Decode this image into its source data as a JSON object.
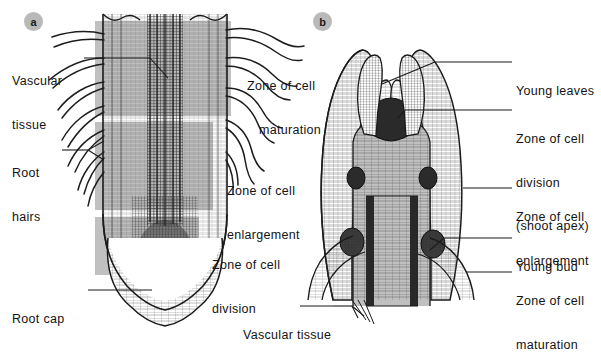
{
  "figure": {
    "background": "#ffffff",
    "band_color": "#c0c0c0",
    "ink_color": "#1a1a1a"
  },
  "panels": [
    {
      "id": "a",
      "badge": "a"
    },
    {
      "id": "b",
      "badge": "b"
    }
  ],
  "panel_a": {
    "left_labels": [
      {
        "name": "vascular-tissue",
        "line1": "Vascular",
        "line2": "tissue"
      },
      {
        "name": "root-hairs",
        "line1": "Root",
        "line2": "hairs"
      },
      {
        "name": "root-cap",
        "line1": "Root cap",
        "line2": ""
      }
    ],
    "right_labels": [
      {
        "name": "zone-of-cell-maturation",
        "line1": "Zone of cell",
        "line2": "maturation"
      },
      {
        "name": "zone-of-cell-enlargement",
        "line1": "Zone of cell",
        "line2": "enlargement"
      },
      {
        "name": "zone-of-cell-division",
        "line1": "Zone of cell",
        "line2": "division"
      }
    ]
  },
  "panel_b": {
    "right_labels": [
      {
        "name": "young-leaves",
        "line1": "Young leaves",
        "line2": "",
        "line3": ""
      },
      {
        "name": "zone-of-cell-division-shoot-apex",
        "line1": "Zone of cell",
        "line2": "division",
        "line3": "(shoot apex)"
      },
      {
        "name": "zone-of-cell-enlargement",
        "line1": "Zone of cell",
        "line2": "enlargement",
        "line3": ""
      },
      {
        "name": "young-bud",
        "line1": "Young bud",
        "line2": "",
        "line3": ""
      },
      {
        "name": "zone-of-cell-maturation",
        "line1": "Zone of cell",
        "line2": "maturation",
        "line3": ""
      }
    ],
    "bottom_label": {
      "name": "vascular-tissue",
      "line1": "Vascular tissue"
    }
  }
}
